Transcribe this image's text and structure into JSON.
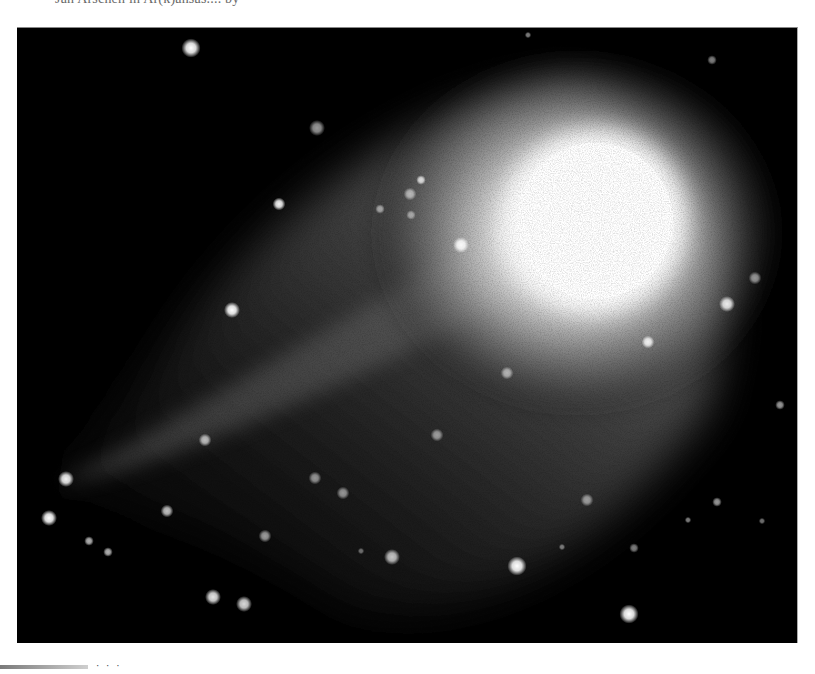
{
  "page": {
    "caption_top": "Jan Arschen in Ar(k)ansas....   by                 ",
    "footer_text": "· · ·"
  },
  "photo": {
    "subject": "comet with bright nucleus, diffuse coma and faint tail against a star field",
    "alt": "Comet photograph",
    "colors": {
      "sky": "#000000",
      "nucleus": "#ffffff",
      "coma": "#bfbfbf",
      "tail": "#5a5a5a"
    },
    "nucleus": {
      "cx": 578,
      "cy": 193,
      "r": 95
    },
    "stars": [
      {
        "x": 174,
        "y": 20,
        "r": 6,
        "o": 1.0
      },
      {
        "x": 300,
        "y": 100,
        "r": 5,
        "o": 0.6
      },
      {
        "x": 262,
        "y": 176,
        "r": 4,
        "o": 0.95
      },
      {
        "x": 404,
        "y": 152,
        "r": 3,
        "o": 0.8
      },
      {
        "x": 393,
        "y": 166,
        "r": 4,
        "o": 0.6
      },
      {
        "x": 363,
        "y": 181,
        "r": 3,
        "o": 0.55
      },
      {
        "x": 394,
        "y": 187,
        "r": 3,
        "o": 0.5
      },
      {
        "x": 444,
        "y": 217,
        "r": 5,
        "o": 0.95
      },
      {
        "x": 215,
        "y": 282,
        "r": 5,
        "o": 1.0
      },
      {
        "x": 511,
        "y": 7,
        "r": 2,
        "o": 0.5
      },
      {
        "x": 695,
        "y": 32,
        "r": 3,
        "o": 0.5
      },
      {
        "x": 738,
        "y": 250,
        "r": 4,
        "o": 0.55
      },
      {
        "x": 710,
        "y": 276,
        "r": 5,
        "o": 0.9
      },
      {
        "x": 631,
        "y": 314,
        "r": 4,
        "o": 0.9
      },
      {
        "x": 763,
        "y": 377,
        "r": 3,
        "o": 0.6
      },
      {
        "x": 490,
        "y": 345,
        "r": 4,
        "o": 0.6
      },
      {
        "x": 188,
        "y": 412,
        "r": 4,
        "o": 0.7
      },
      {
        "x": 49,
        "y": 451,
        "r": 5,
        "o": 0.95
      },
      {
        "x": 32,
        "y": 490,
        "r": 5,
        "o": 1.0
      },
      {
        "x": 150,
        "y": 483,
        "r": 4,
        "o": 0.75
      },
      {
        "x": 298,
        "y": 450,
        "r": 4,
        "o": 0.55
      },
      {
        "x": 326,
        "y": 465,
        "r": 4,
        "o": 0.55
      },
      {
        "x": 420,
        "y": 407,
        "r": 4,
        "o": 0.55
      },
      {
        "x": 72,
        "y": 513,
        "r": 3,
        "o": 0.7
      },
      {
        "x": 91,
        "y": 524,
        "r": 3,
        "o": 0.7
      },
      {
        "x": 248,
        "y": 508,
        "r": 4,
        "o": 0.6
      },
      {
        "x": 375,
        "y": 529,
        "r": 5,
        "o": 0.75
      },
      {
        "x": 500,
        "y": 538,
        "r": 6,
        "o": 1.0
      },
      {
        "x": 570,
        "y": 472,
        "r": 4,
        "o": 0.55
      },
      {
        "x": 617,
        "y": 520,
        "r": 3,
        "o": 0.5
      },
      {
        "x": 700,
        "y": 474,
        "r": 3,
        "o": 0.6
      },
      {
        "x": 671,
        "y": 492,
        "r": 2,
        "o": 0.5
      },
      {
        "x": 745,
        "y": 493,
        "r": 2,
        "o": 0.45
      },
      {
        "x": 196,
        "y": 569,
        "r": 5,
        "o": 0.9
      },
      {
        "x": 227,
        "y": 576,
        "r": 5,
        "o": 0.85
      },
      {
        "x": 612,
        "y": 586,
        "r": 6,
        "o": 1.0
      },
      {
        "x": 545,
        "y": 519,
        "r": 2,
        "o": 0.45
      },
      {
        "x": 344,
        "y": 523,
        "r": 2,
        "o": 0.4
      }
    ]
  }
}
